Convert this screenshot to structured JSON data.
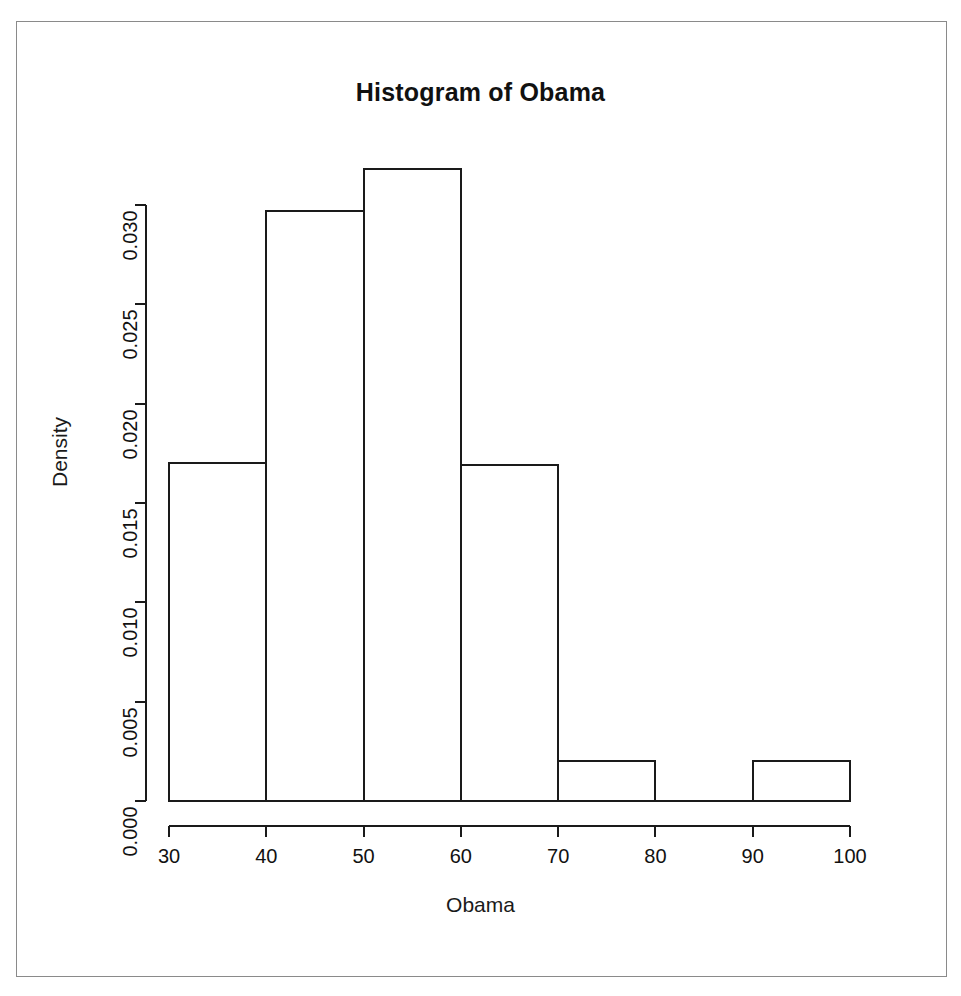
{
  "figure": {
    "title": "Histogram of Obama",
    "background_color": "#ffffff",
    "line_color": "#1a1a1a",
    "frame_color": "#8a8a8a"
  },
  "chart_data": {
    "type": "bar",
    "title": "Histogram of Obama",
    "xlabel": "Obama",
    "ylabel": "Density",
    "xlim": [
      30,
      100
    ],
    "ylim": [
      0.0,
      0.032
    ],
    "grid": false,
    "legend": null,
    "bin_width": 10,
    "bin_edges": [
      30,
      40,
      50,
      60,
      70,
      80,
      90,
      100
    ],
    "categories": [
      "30-40",
      "40-50",
      "50-60",
      "60-70",
      "70-80",
      "80-90",
      "90-100"
    ],
    "values": [
      0.017,
      0.0297,
      0.0318,
      0.0169,
      0.002,
      0.0,
      0.002
    ],
    "xticks": [
      30,
      40,
      50,
      60,
      70,
      80,
      90,
      100
    ],
    "xtick_labels": [
      "30",
      "40",
      "50",
      "60",
      "70",
      "80",
      "90",
      "100"
    ],
    "yticks": [
      0.0,
      0.005,
      0.01,
      0.015,
      0.02,
      0.025,
      0.03
    ],
    "ytick_labels": [
      "0.000",
      "0.005",
      "0.010",
      "0.015",
      "0.020",
      "0.025",
      "0.030"
    ]
  }
}
